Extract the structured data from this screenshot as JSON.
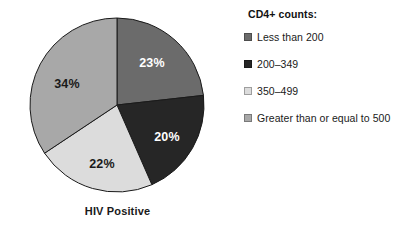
{
  "chart_data": {
    "type": "pie",
    "title": "",
    "caption": "HIV Positive",
    "legend_title": "CD4+ counts:",
    "legend_position": "right",
    "start_angle_deg": 0,
    "direction": "clockwise",
    "categories": [
      "Less than 200",
      "200–349",
      "350–499",
      "Greater than or equal to 500"
    ],
    "values": [
      23,
      20,
      22,
      34
    ],
    "value_labels": [
      "23%",
      "20%",
      "22%",
      "34%"
    ],
    "colors": [
      "#6b6b6b",
      "#262626",
      "#dcdcdc",
      "#a8a8a8"
    ],
    "label_text_colors": [
      "#ffffff",
      "#ffffff",
      "#1a1a1a",
      "#1a1a1a"
    ],
    "slices": [
      {
        "label": "Less than 200",
        "value": 23,
        "value_label": "23%",
        "color": "#6b6b6b",
        "label_color": "#ffffff",
        "label_x": 152,
        "label_y": 64
      },
      {
        "label": "200–349",
        "value": 20,
        "value_label": "20%",
        "color": "#262626",
        "label_color": "#ffffff",
        "label_x": 167,
        "label_y": 138
      },
      {
        "label": "350–499",
        "value": 22,
        "value_label": "22%",
        "color": "#dcdcdc",
        "label_color": "#1a1a1a",
        "label_x": 102,
        "label_y": 165
      },
      {
        "label": "Greater than or equal to 500",
        "value": 34,
        "value_label": "34%",
        "color": "#a8a8a8",
        "label_color": "#1a1a1a",
        "label_x": 67,
        "label_y": 85
      }
    ],
    "geometry": {
      "center_x": 117,
      "center_y": 105,
      "radius": 87,
      "stroke_color": "#1a1a1a",
      "stroke_width": 1
    },
    "background_color": "#ffffff"
  },
  "pie": {
    "caption": "HIV Positive"
  },
  "legend": {
    "title": "CD4+ counts:",
    "items": [
      {
        "label": "Less than 200",
        "color": "#6b6b6b"
      },
      {
        "label": "200–349",
        "color": "#262626"
      },
      {
        "label": "350–499",
        "color": "#dcdcdc"
      },
      {
        "label": "Greater than or equal to 500",
        "color": "#a8a8a8"
      }
    ]
  }
}
